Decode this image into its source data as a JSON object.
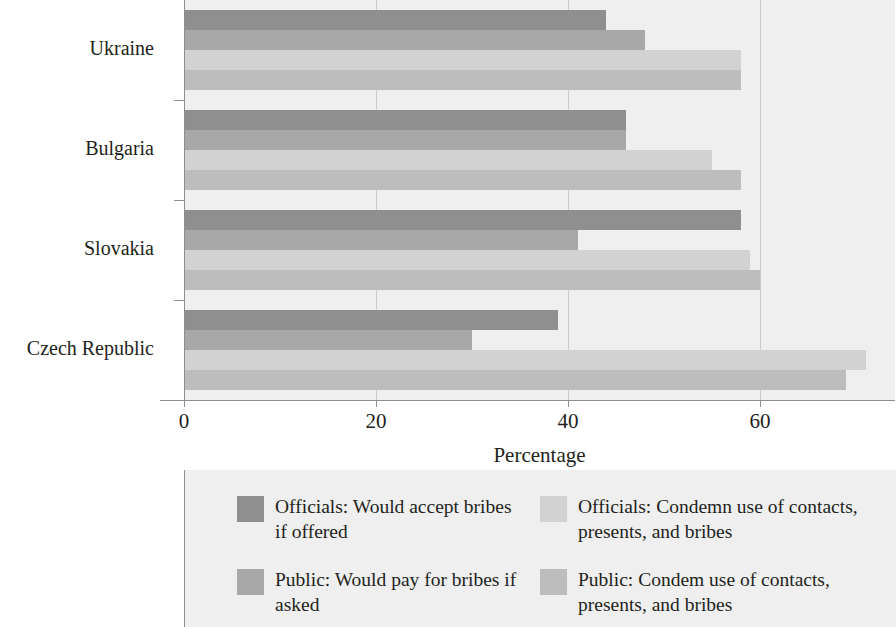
{
  "chart_data": {
    "type": "bar",
    "orientation": "horizontal",
    "title": "",
    "xlabel": "Percentage",
    "ylabel": "",
    "xlim": [
      0,
      74
    ],
    "xticks": [
      0,
      20,
      40,
      60
    ],
    "xticklabels": [
      "0",
      "20",
      "40",
      "60"
    ],
    "grid": "vertical",
    "legend_position": "bottom",
    "categories": [
      "Czech Republic",
      "Slovakia",
      "Bulgaria",
      "Ukraine"
    ],
    "series": [
      {
        "name": "Officials: Would accept bribes if offered",
        "color": "#8f8f8f",
        "values": [
          39,
          58,
          46,
          44
        ]
      },
      {
        "name": "Public: Would pay for bribes if asked",
        "color": "#a8a8a8",
        "values": [
          30,
          41,
          46,
          48
        ]
      },
      {
        "name": "Officials: Condemn use of contacts, presents, and bribes",
        "color": "#d2d2d2",
        "values": [
          71,
          59,
          55,
          58
        ]
      },
      {
        "name": "Public: Condem use of contacts, presents, and bribes",
        "color": "#bdbdbd",
        "values": [
          69,
          60,
          58,
          58
        ]
      }
    ]
  },
  "axis": {
    "xlabel": "Percentage",
    "ticks": [
      {
        "value": "0"
      },
      {
        "value": "20"
      },
      {
        "value": "40"
      },
      {
        "value": "60"
      }
    ],
    "categories": [
      {
        "label": "Ukraine"
      },
      {
        "label": "Bulgaria"
      },
      {
        "label": "Slovakia"
      },
      {
        "label": "Czech Republic"
      }
    ]
  },
  "legend": {
    "items": [
      {
        "label": "Officials: Would accept bribes if offered",
        "color": "#8f8f8f"
      },
      {
        "label": "Officials: Condemn use of contacts, presents, and bribes",
        "color": "#d2d2d2"
      },
      {
        "label": "Public: Would pay for bribes if asked",
        "color": "#a8a8a8"
      },
      {
        "label": "Public: Condem use of contacts, presents, and bribes",
        "color": "#bdbdbd"
      }
    ]
  }
}
